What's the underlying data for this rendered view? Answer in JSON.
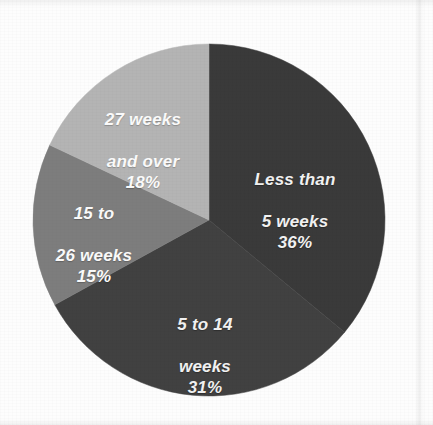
{
  "background": {
    "page_color": "#fdfdfd"
  },
  "chart_data": {
    "type": "pie",
    "title": "",
    "subtitle": "",
    "xlabel": "",
    "ylabel": "",
    "legend_position": "none",
    "grid": false,
    "labels_inside_slices": true,
    "start_angle_deg": 0,
    "direction": "clockwise",
    "categories": [
      "Less than 5 weeks",
      "5 to 14 weeks",
      "15 to 26 weeks",
      "27 weeks and over"
    ],
    "values": [
      36,
      31,
      15,
      18
    ],
    "value_unit": "percent",
    "slices": [
      {
        "label": "Less than\n5 weeks",
        "label_line1": "Less than",
        "label_line2": "5 weeks",
        "percent": "36%",
        "value": 36,
        "angle_deg": 129.6,
        "color": "#3a3a3a",
        "text_color": "#f2f2f2"
      },
      {
        "label": "5 to 14\nweeks",
        "label_line1": "5 to 14",
        "label_line2": "weeks",
        "percent": "31%",
        "value": 31,
        "angle_deg": 111.6,
        "color": "#414141",
        "text_color": "#f2f2f2"
      },
      {
        "label": "15 to\n26 weeks",
        "label_line1": "15 to",
        "label_line2": "26 weeks",
        "percent": "15%",
        "value": 15,
        "angle_deg": 54.0,
        "color": "#7d7d7d",
        "text_color": "#fbfbfb"
      },
      {
        "label": "27 weeks\nand over",
        "label_line1": "27 weeks",
        "label_line2": "and over",
        "percent": "18%",
        "value": 18,
        "angle_deg": 64.8,
        "color": "#b4b4b4",
        "text_color": "#fbfbfb"
      }
    ],
    "geometry": {
      "center_x": 209,
      "center_y": 220,
      "radius": 176
    }
  }
}
